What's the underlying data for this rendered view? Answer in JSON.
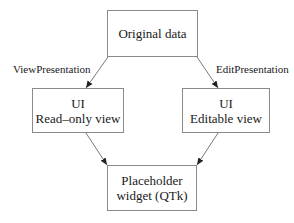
{
  "diagram": {
    "type": "flowchart",
    "nodes": {
      "original": {
        "lines": [
          "Original data"
        ]
      },
      "readonly": {
        "lines": [
          "UI",
          "Read–only view"
        ]
      },
      "editable": {
        "lines": [
          "UI",
          "Editable view"
        ]
      },
      "placeholder": {
        "lines": [
          "Placeholder",
          "widget (QTk)"
        ]
      }
    },
    "edges": [
      {
        "from": "original",
        "to": "readonly",
        "label": "ViewPresentation"
      },
      {
        "from": "original",
        "to": "editable",
        "label": "EditPresentation"
      },
      {
        "from": "readonly",
        "to": "placeholder",
        "label": ""
      },
      {
        "from": "editable",
        "to": "placeholder",
        "label": ""
      }
    ],
    "colors": {
      "border": "#8a8a8a",
      "arrow": "#333333",
      "text": "#1a1a1a"
    }
  }
}
